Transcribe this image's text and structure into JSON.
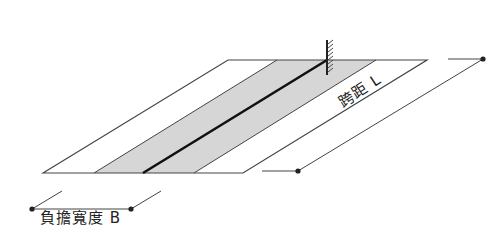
{
  "diagram": {
    "labels": {
      "load_width": "負擔寬度 B",
      "span": "跨距 L"
    },
    "colors": {
      "line": "#3a3a3a",
      "strip_fill": "#d4d4d4",
      "center_line": "#111111",
      "background": "#ffffff"
    },
    "elements": {
      "slab": "parallelogram slab outline",
      "strip": "shaded load-bearing strip",
      "beam": "center beam line",
      "support": "fixed support (hatched wall)"
    }
  }
}
